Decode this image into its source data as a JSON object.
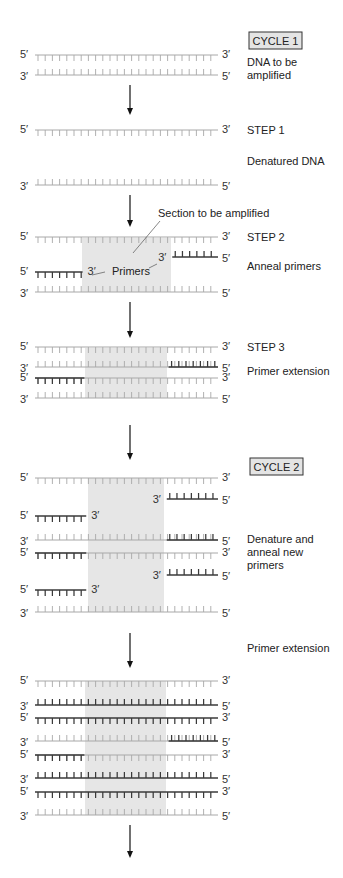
{
  "colors": {
    "original_strand": "#a8a8a8",
    "new_strand": "#3a3a3a",
    "shade": "#e6e6e6",
    "box_fill": "#e4e4e4",
    "arrow": "#111111"
  },
  "end_labels": {
    "five_prime": "5′",
    "three_prime": "3′"
  },
  "cycles": [
    {
      "id": "cycle1",
      "label": "CYCLE 1"
    },
    {
      "id": "cycle2",
      "label": "CYCLE 2"
    }
  ],
  "side_labels": [
    {
      "id": "dna-to-be-amplified",
      "lines": [
        "DNA to be",
        "amplified"
      ]
    },
    {
      "id": "step1",
      "lines": [
        "STEP 1"
      ]
    },
    {
      "id": "denatured-dna",
      "lines": [
        "Denatured DNA"
      ]
    },
    {
      "id": "step2",
      "lines": [
        "STEP 2"
      ]
    },
    {
      "id": "anneal-primers",
      "lines": [
        "Anneal primers"
      ]
    },
    {
      "id": "step3",
      "lines": [
        "STEP 3"
      ]
    },
    {
      "id": "primer-extension-1",
      "lines": [
        "Primer extension"
      ]
    },
    {
      "id": "denature-anneal-new",
      "lines": [
        "Denature and",
        "anneal new",
        "primers"
      ]
    },
    {
      "id": "primer-extension-2",
      "lines": [
        "Primer extension"
      ]
    }
  ],
  "annotations": {
    "section": "Section to be amplified",
    "primers": "Primers"
  },
  "stages": [
    {
      "id": "cycle1-start",
      "strands": [
        {
          "orientation": "5-3",
          "type": "original",
          "segments": [
            [
              0,
              1
            ]
          ]
        },
        {
          "orientation": "3-5",
          "type": "original",
          "segments": [
            [
              0,
              1
            ]
          ]
        }
      ]
    },
    {
      "id": "step1-denatured",
      "strands": [
        {
          "orientation": "5-3",
          "type": "original",
          "segments": [
            [
              0,
              1
            ]
          ]
        },
        {
          "orientation": "3-5",
          "type": "original",
          "segments": [
            [
              0,
              1
            ]
          ]
        }
      ]
    },
    {
      "id": "step2-anneal",
      "strands": [
        {
          "orientation": "5-3",
          "type": "original",
          "segments": [
            [
              0,
              1
            ]
          ]
        },
        {
          "orientation": "3-5",
          "type": "primer",
          "segments": [
            [
              0.75,
              1
            ]
          ]
        },
        {
          "orientation": "5-3",
          "type": "primer",
          "segments": [
            [
              0,
              0.26
            ]
          ]
        },
        {
          "orientation": "3-5",
          "type": "original",
          "segments": [
            [
              0,
              1
            ]
          ]
        }
      ]
    },
    {
      "id": "step3-extension",
      "strands": [
        {
          "orientation": "5-3",
          "type": "original",
          "segments": [
            [
              0,
              1
            ]
          ]
        },
        {
          "orientation": "3-5",
          "type": "new",
          "primer": [
            0.73,
            1
          ],
          "segments": [
            [
              0,
              1
            ]
          ]
        },
        {
          "orientation": "5-3",
          "type": "new",
          "primer": [
            0,
            0.27
          ],
          "segments": [
            [
              0,
              1
            ]
          ]
        },
        {
          "orientation": "3-5",
          "type": "original",
          "segments": [
            [
              0,
              1
            ]
          ]
        }
      ]
    },
    {
      "id": "cycle2-denature-anneal",
      "strands": [
        {
          "orientation": "5-3",
          "type": "original",
          "segments": [
            [
              0,
              1
            ]
          ]
        },
        {
          "orientation": "3-5",
          "type": "primer",
          "segments": [
            [
              0.72,
              1
            ]
          ]
        },
        {
          "orientation": "5-3",
          "type": "primer",
          "segments": [
            [
              0,
              0.28
            ]
          ]
        },
        {
          "orientation": "3-5",
          "type": "new",
          "primer": [
            0.72,
            1
          ],
          "segments": [
            [
              0,
              1
            ]
          ]
        },
        {
          "orientation": "5-3",
          "type": "new",
          "primer": [
            0,
            0.28
          ],
          "segments": [
            [
              0,
              1
            ]
          ]
        },
        {
          "orientation": "3-5",
          "type": "primer",
          "segments": [
            [
              0.72,
              1
            ]
          ]
        },
        {
          "orientation": "5-3",
          "type": "primer",
          "segments": [
            [
              0,
              0.28
            ]
          ]
        },
        {
          "orientation": "3-5",
          "type": "original",
          "segments": [
            [
              0,
              1
            ]
          ]
        }
      ]
    },
    {
      "id": "cycle2-extension",
      "strands": [
        {
          "orientation": "5-3",
          "type": "original",
          "segments": [
            [
              0,
              1
            ]
          ]
        },
        {
          "orientation": "3-5",
          "type": "full-new",
          "segments": [
            [
              0,
              1
            ]
          ]
        },
        {
          "orientation": "5-3",
          "type": "full-new",
          "segments": [
            [
              0,
              1
            ]
          ]
        },
        {
          "orientation": "3-5",
          "type": "new",
          "primer": [
            0.73,
            1
          ],
          "segments": [
            [
              0,
              1
            ]
          ]
        },
        {
          "orientation": "5-3",
          "type": "new",
          "primer": [
            0,
            0.27
          ],
          "segments": [
            [
              0,
              1
            ]
          ]
        },
        {
          "orientation": "3-5",
          "type": "full-new",
          "segments": [
            [
              0,
              1
            ]
          ]
        },
        {
          "orientation": "5-3",
          "type": "full-new",
          "segments": [
            [
              0,
              1
            ]
          ]
        },
        {
          "orientation": "3-5",
          "type": "original",
          "segments": [
            [
              0,
              1
            ]
          ]
        }
      ]
    }
  ]
}
